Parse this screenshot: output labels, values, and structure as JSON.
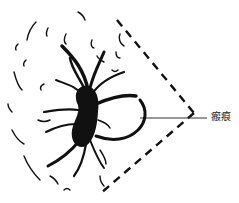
{
  "figure": {
    "type": "medical-illustration",
    "annotations": [
      {
        "label": "瘢痕",
        "meaning": "scar"
      }
    ],
    "colors": {
      "ink": "#111111",
      "background": "#ffffff"
    }
  }
}
